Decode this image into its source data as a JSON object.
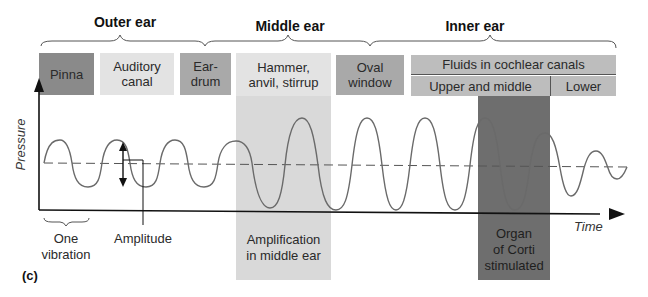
{
  "regions": {
    "outer": "Outer ear",
    "middle": "Middle ear",
    "inner": "Inner ear"
  },
  "structures": {
    "pinna": "Pinna",
    "auditory_canal_1": "Auditory",
    "auditory_canal_2": "canal",
    "eardrum_1": "Ear-",
    "eardrum_2": "drum",
    "ossicles_1": "Hammer,",
    "ossicles_2": "anvil, stirrup",
    "oval_1": "Oval",
    "oval_2": "window",
    "fluids": "Fluids in cochlear canals",
    "upper_middle": "Upper and middle",
    "lower": "Lower"
  },
  "axes": {
    "y_label": "Pressure",
    "x_label": "Time"
  },
  "annotations": {
    "one_vibration_1": "One",
    "one_vibration_2": "vibration",
    "amplitude": "Amplitude",
    "amplification_1": "Amplification",
    "amplification_2": "in middle ear",
    "corti_1": "Organ",
    "corti_2": "of Corti",
    "corti_3": "stimulated"
  },
  "panel_label": "(c)",
  "colors": {
    "dark_box": "#8a8a8a",
    "light_box": "#e3e3e3",
    "medium_box": "#a9a9a9",
    "middle_band": "#d9d9d9",
    "corti_band": "#6e6e6e",
    "wave": "#6a6a6a"
  }
}
